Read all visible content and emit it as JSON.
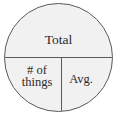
{
  "diagram": {
    "shape": "circle",
    "sections": {
      "top": {
        "label": "Total"
      },
      "bottom_left": {
        "label_line1": "# of",
        "label_line2": "things"
      },
      "bottom_right": {
        "label": "Avg."
      }
    },
    "colors": {
      "fill": "#f1f1f1",
      "stroke": "#5a5a5a",
      "text": "#2a2a2a",
      "background": "#ffffff"
    }
  }
}
